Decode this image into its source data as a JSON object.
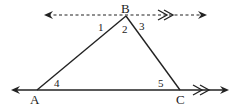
{
  "diagram": {
    "type": "geometry",
    "vertices": {
      "A": {
        "label": "A",
        "x": 37,
        "y": 90
      },
      "B": {
        "label": "B",
        "x": 126,
        "y": 16
      },
      "C": {
        "label": "C",
        "x": 180,
        "y": 90
      }
    },
    "angles": [
      {
        "label": "1",
        "x": 101,
        "y": 30
      },
      {
        "label": "2",
        "x": 122,
        "y": 33
      },
      {
        "label": "3",
        "x": 139,
        "y": 30
      },
      {
        "label": "4",
        "x": 54,
        "y": 87
      },
      {
        "label": "5",
        "x": 158,
        "y": 86
      }
    ],
    "lines": {
      "parallel_top": {
        "style": "dashed",
        "y": 15,
        "x1": 45,
        "x2": 206,
        "parallel_mark": "double-chevron"
      },
      "base_AC": {
        "style": "solid",
        "y": 90,
        "x1": 11,
        "x2": 229,
        "parallel_mark": "double-chevron"
      }
    },
    "colors": {
      "stroke": "#222222"
    }
  }
}
